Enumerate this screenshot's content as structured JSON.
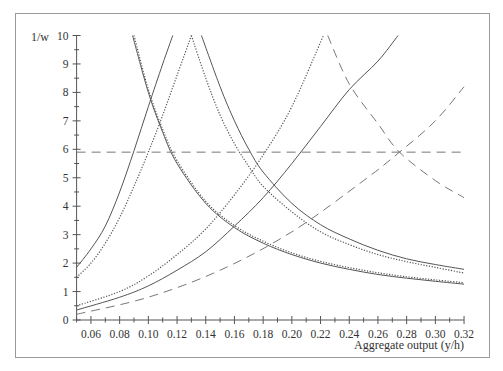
{
  "chart_data": {
    "type": "line",
    "title": "",
    "xlabel": "Aggregate output (y/h)",
    "ylabel": "1/w",
    "xlim": [
      0.05,
      0.32
    ],
    "ylim": [
      0,
      10
    ],
    "grid": false,
    "legend": null,
    "x_ticks": [
      "0.06",
      "0.08",
      "0.10",
      "0.12",
      "0.14",
      "0.16",
      "0.18",
      "0.20",
      "0.22",
      "0.24",
      "0.26",
      "0.28",
      "0.30",
      "0.32"
    ],
    "y_ticks": [
      "0",
      "1",
      "2",
      "3",
      "4",
      "5",
      "6",
      "7",
      "8",
      "9",
      "10"
    ],
    "series": [
      {
        "name": "solid-increasing-steep",
        "style": "solid",
        "points": [
          [
            0.05,
            1.85
          ],
          [
            0.06,
            2.5
          ],
          [
            0.07,
            3.3
          ],
          [
            0.08,
            4.5
          ],
          [
            0.09,
            5.95
          ],
          [
            0.1,
            7.5
          ],
          [
            0.11,
            9.0
          ],
          [
            0.117,
            10
          ]
        ]
      },
      {
        "name": "dotted-increasing-steep",
        "style": "dotted",
        "points": [
          [
            0.05,
            1.5
          ],
          [
            0.06,
            2.0
          ],
          [
            0.07,
            2.7
          ],
          [
            0.08,
            3.6
          ],
          [
            0.09,
            4.7
          ],
          [
            0.1,
            5.9
          ],
          [
            0.11,
            7.2
          ],
          [
            0.12,
            8.6
          ],
          [
            0.13,
            10
          ]
        ]
      },
      {
        "name": "solid-decreasing-lower",
        "style": "solid",
        "points": [
          [
            0.089,
            10
          ],
          [
            0.1,
            8.0
          ],
          [
            0.11,
            6.6
          ],
          [
            0.12,
            5.5
          ],
          [
            0.14,
            4.1
          ],
          [
            0.16,
            3.25
          ],
          [
            0.18,
            2.7
          ],
          [
            0.2,
            2.3
          ],
          [
            0.22,
            2.0
          ],
          [
            0.24,
            1.78
          ],
          [
            0.26,
            1.6
          ],
          [
            0.28,
            1.47
          ],
          [
            0.3,
            1.36
          ],
          [
            0.32,
            1.26
          ]
        ]
      },
      {
        "name": "dotted-decreasing-lower",
        "style": "dotted",
        "points": [
          [
            0.09,
            10
          ],
          [
            0.1,
            8.1
          ],
          [
            0.11,
            6.7
          ],
          [
            0.12,
            5.6
          ],
          [
            0.14,
            4.17
          ],
          [
            0.16,
            3.32
          ],
          [
            0.18,
            2.77
          ],
          [
            0.2,
            2.36
          ],
          [
            0.22,
            2.06
          ],
          [
            0.24,
            1.84
          ],
          [
            0.26,
            1.66
          ],
          [
            0.28,
            1.52
          ],
          [
            0.3,
            1.41
          ],
          [
            0.32,
            1.31
          ]
        ]
      },
      {
        "name": "dotted-decreasing-upper",
        "style": "dotted",
        "points": [
          [
            0.13,
            10
          ],
          [
            0.14,
            8.5
          ],
          [
            0.15,
            7.2
          ],
          [
            0.16,
            6.2
          ],
          [
            0.17,
            5.4
          ],
          [
            0.18,
            4.7
          ],
          [
            0.2,
            3.8
          ],
          [
            0.22,
            3.1
          ],
          [
            0.24,
            2.65
          ],
          [
            0.26,
            2.3
          ],
          [
            0.28,
            2.05
          ],
          [
            0.3,
            1.85
          ],
          [
            0.32,
            1.65
          ]
        ]
      },
      {
        "name": "solid-decreasing-upper",
        "style": "solid",
        "points": [
          [
            0.137,
            10
          ],
          [
            0.15,
            8.2
          ],
          [
            0.16,
            7.0
          ],
          [
            0.17,
            6.0
          ],
          [
            0.18,
            5.2
          ],
          [
            0.2,
            4.1
          ],
          [
            0.22,
            3.35
          ],
          [
            0.24,
            2.85
          ],
          [
            0.26,
            2.45
          ],
          [
            0.28,
            2.15
          ],
          [
            0.3,
            1.95
          ],
          [
            0.32,
            1.78
          ]
        ]
      },
      {
        "name": "dotted-increasing-shallow",
        "style": "dotted",
        "points": [
          [
            0.05,
            0.5
          ],
          [
            0.08,
            1.0
          ],
          [
            0.1,
            1.55
          ],
          [
            0.12,
            2.3
          ],
          [
            0.14,
            3.2
          ],
          [
            0.16,
            4.4
          ],
          [
            0.18,
            5.8
          ],
          [
            0.2,
            7.5
          ],
          [
            0.222,
            10
          ]
        ]
      },
      {
        "name": "solid-increasing-shallow",
        "style": "solid",
        "points": [
          [
            0.05,
            0.35
          ],
          [
            0.08,
            0.8
          ],
          [
            0.1,
            1.2
          ],
          [
            0.12,
            1.75
          ],
          [
            0.14,
            2.4
          ],
          [
            0.16,
            3.3
          ],
          [
            0.18,
            4.3
          ],
          [
            0.2,
            5.5
          ],
          [
            0.22,
            6.8
          ],
          [
            0.24,
            8.1
          ],
          [
            0.26,
            9.1
          ],
          [
            0.274,
            10
          ]
        ]
      },
      {
        "name": "dashed-increasing",
        "style": "dashed",
        "points": [
          [
            0.05,
            0.2
          ],
          [
            0.1,
            0.8
          ],
          [
            0.15,
            1.75
          ],
          [
            0.2,
            3.1
          ],
          [
            0.25,
            4.9
          ],
          [
            0.275,
            5.9
          ],
          [
            0.3,
            7.0
          ],
          [
            0.32,
            8.2
          ]
        ]
      },
      {
        "name": "dashed-decreasing",
        "style": "dashed",
        "points": [
          [
            0.225,
            10
          ],
          [
            0.24,
            8.3
          ],
          [
            0.26,
            6.9
          ],
          [
            0.275,
            5.9
          ],
          [
            0.3,
            4.9
          ],
          [
            0.32,
            4.3
          ]
        ]
      },
      {
        "name": "dashed-horizontal",
        "style": "dashed",
        "points": [
          [
            0.05,
            5.9
          ],
          [
            0.32,
            5.9
          ]
        ]
      }
    ]
  },
  "axes": {
    "y_label": "1/w",
    "x_label": "Aggregate output (y/h)"
  },
  "colors": {
    "line": "#555555",
    "axis": "#555555",
    "frame": "#9a9a9a",
    "text": "#333333"
  }
}
